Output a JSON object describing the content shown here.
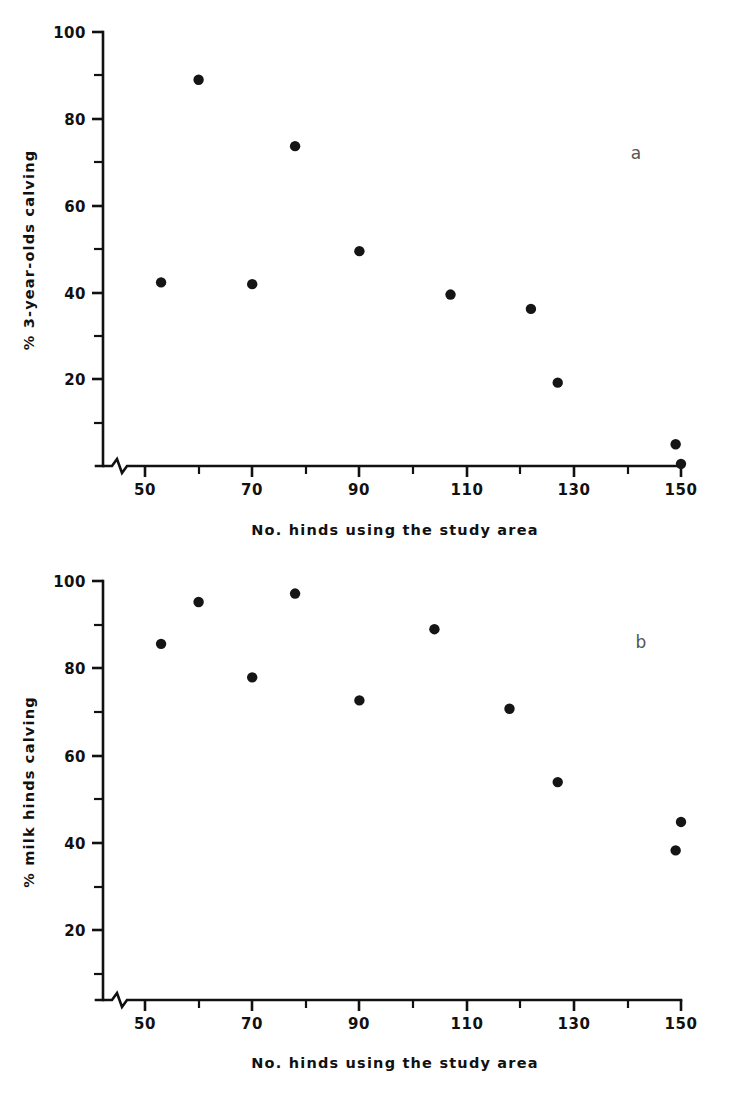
{
  "figure": {
    "background": "#ffffff",
    "marker_color": "#151515",
    "axis_color": "#111111"
  },
  "panels": [
    {
      "id": "a",
      "label": "a",
      "xlabel": "No. hinds using the study area",
      "ylabel": "% 3-year-olds calving",
      "x_ticks": [
        "50",
        "70",
        "90",
        "110",
        "130",
        "150"
      ],
      "y_ticks": [
        "100",
        "80",
        "60",
        "40",
        "20"
      ]
    },
    {
      "id": "b",
      "label": "b",
      "xlabel": "No. hinds using the study area",
      "ylabel": "% milk hinds calving",
      "x_ticks": [
        "50",
        "70",
        "90",
        "110",
        "130",
        "150"
      ],
      "y_ticks": [
        "100",
        "80",
        "60",
        "40",
        "20"
      ]
    }
  ],
  "chart_data": [
    {
      "type": "scatter",
      "panel": "a",
      "title": "",
      "xlabel": "No. hinds using the study area",
      "ylabel": "% 3-year-olds calving",
      "xlim": [
        44,
        152
      ],
      "ylim": [
        0,
        100
      ],
      "axis_break_x": true,
      "grid": false,
      "legend": null,
      "x_major_ticks": [
        50,
        70,
        90,
        110,
        130,
        150
      ],
      "x_minor_ticks": [
        60,
        80,
        100,
        120,
        140
      ],
      "y_major_ticks": [
        0,
        20,
        40,
        60,
        80,
        100
      ],
      "y_minor_ticks": [
        10,
        30,
        50,
        70,
        90
      ],
      "x": [
        53,
        60,
        70,
        78,
        90,
        107,
        122,
        127,
        149,
        150
      ],
      "y": [
        42.3,
        89.0,
        41.9,
        73.7,
        49.5,
        39.5,
        36.2,
        19.2,
        5.0,
        0.5
      ],
      "points": [
        {
          "x": 53,
          "y": 42.3
        },
        {
          "x": 60,
          "y": 89.0
        },
        {
          "x": 70,
          "y": 41.9
        },
        {
          "x": 78,
          "y": 73.7
        },
        {
          "x": 90,
          "y": 49.5
        },
        {
          "x": 107,
          "y": 39.5
        },
        {
          "x": 122,
          "y": 36.2
        },
        {
          "x": 127,
          "y": 19.2
        },
        {
          "x": 149,
          "y": 5.0
        },
        {
          "x": 150,
          "y": 0.5
        }
      ]
    },
    {
      "type": "scatter",
      "panel": "b",
      "title": "",
      "xlabel": "No. hinds using the study area",
      "ylabel": "% milk hinds calving",
      "xlim": [
        44,
        152
      ],
      "ylim": [
        0,
        100
      ],
      "axis_break_x": true,
      "grid": false,
      "legend": null,
      "x_major_ticks": [
        50,
        70,
        90,
        110,
        130,
        150
      ],
      "x_minor_ticks": [
        60,
        80,
        100,
        120,
        140
      ],
      "y_major_ticks": [
        0,
        20,
        40,
        60,
        80,
        100
      ],
      "y_minor_ticks": [
        10,
        30,
        50,
        70,
        90
      ],
      "x": [
        53,
        60,
        70,
        78,
        90,
        104,
        118,
        127,
        149,
        150
      ],
      "y": [
        85.0,
        95.0,
        77.0,
        97.0,
        71.5,
        88.5,
        69.5,
        52.0,
        35.7,
        42.5
      ],
      "points": [
        {
          "x": 53,
          "y": 85.0
        },
        {
          "x": 60,
          "y": 95.0
        },
        {
          "x": 70,
          "y": 77.0
        },
        {
          "x": 78,
          "y": 97.0
        },
        {
          "x": 90,
          "y": 71.5
        },
        {
          "x": 104,
          "y": 88.5
        },
        {
          "x": 118,
          "y": 69.5
        },
        {
          "x": 127,
          "y": 52.0
        },
        {
          "x": 149,
          "y": 35.7
        },
        {
          "x": 150,
          "y": 42.5
        }
      ]
    }
  ]
}
